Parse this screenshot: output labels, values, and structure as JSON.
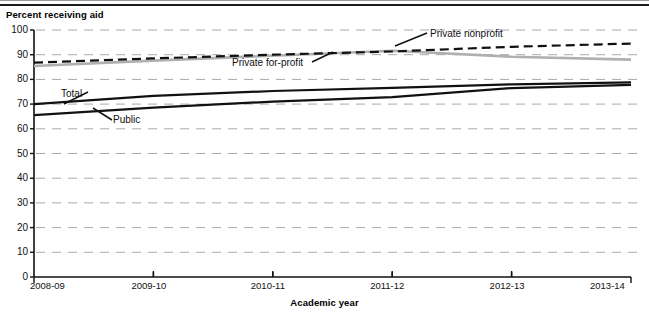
{
  "chart_data": {
    "type": "line",
    "title": "",
    "xlabel": "Academic year",
    "ylabel": "Percent receiving aid",
    "categories": [
      "2008-09",
      "2009-10",
      "2010-11",
      "2011-12",
      "2012-13",
      "2013-14"
    ],
    "ylim": [
      0,
      100
    ],
    "ytick_step": 10,
    "yticks": [
      100,
      90,
      80,
      70,
      60,
      50,
      40,
      30,
      20,
      10,
      0
    ],
    "grid": true,
    "grid_style": "dashed-horizontal",
    "legend_position": "inline-annotations",
    "series": [
      {
        "name": "Total",
        "values": [
          70.0,
          73.3,
          75.3,
          76.6,
          78.0,
          78.8
        ],
        "color": "#111111",
        "style": "solid",
        "width": 2.2,
        "label_x": 61,
        "label_y": 88
      },
      {
        "name": "Public",
        "values": [
          65.5,
          68.6,
          71.0,
          72.8,
          76.5,
          77.8
        ],
        "color": "#111111",
        "style": "solid",
        "width": 2.2,
        "label_x": 113,
        "label_y": 114
      },
      {
        "name": "Private nonprofit",
        "values": [
          86.8,
          88.5,
          90.0,
          91.3,
          93.2,
          94.5
        ],
        "color": "#111111",
        "style": "dashed",
        "width": 2.2,
        "label_x": 430,
        "label_y": 28
      },
      {
        "name": "Private for-profit",
        "values": [
          85.4,
          87.6,
          89.6,
          91.6,
          89.2,
          88.0
        ],
        "color": "#b0b0b0",
        "style": "solid",
        "width": 2.6,
        "label_x": 232,
        "label_y": 57
      }
    ]
  },
  "axes": {
    "y_caption": "Percent receiving aid",
    "x_caption": "Academic year"
  },
  "colors": {
    "axis": "#111111",
    "grid": "#a8a8a8",
    "background": "#ffffff",
    "dark_series": "#111111",
    "gray_series": "#b0b0b0"
  }
}
